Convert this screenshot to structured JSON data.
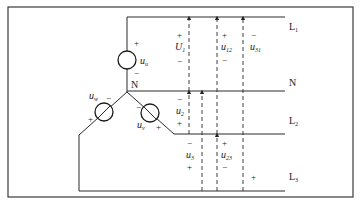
{
  "diagram": {
    "lines": [
      {
        "id": "L1",
        "label": "L",
        "sub": "1"
      },
      {
        "id": "N",
        "label": "N",
        "sub": ""
      },
      {
        "id": "L2",
        "label": "L",
        "sub": "2"
      },
      {
        "id": "L3",
        "label": "L",
        "sub": "3"
      }
    ],
    "node_label": "N",
    "sources": [
      {
        "id": "uu",
        "symbol": "u",
        "sub": "u",
        "plus": "+",
        "minus": "−"
      },
      {
        "id": "uv",
        "symbol": "u",
        "sub": "v",
        "plus": "+",
        "minus": "−"
      },
      {
        "id": "uw",
        "symbol": "u",
        "sub": "w",
        "plus": "+",
        "minus": "−"
      }
    ],
    "voltages": [
      {
        "id": "U1",
        "symbol": "U",
        "sub": "1",
        "top": "+",
        "bottom": "−"
      },
      {
        "id": "u2",
        "symbol": "u",
        "sub": "2",
        "top": "−",
        "bottom": "+"
      },
      {
        "id": "u3",
        "symbol": "u",
        "sub": "3",
        "top": "−",
        "bottom": "+"
      },
      {
        "id": "u12",
        "symbol": "u",
        "sub": "12",
        "top": "+",
        "bottom": "−"
      },
      {
        "id": "u23",
        "symbol": "u",
        "sub": "23",
        "top": "+",
        "bottom": "−"
      },
      {
        "id": "u31",
        "symbol": "u",
        "sub": "31",
        "top": "−",
        "bottom": "+"
      }
    ]
  }
}
